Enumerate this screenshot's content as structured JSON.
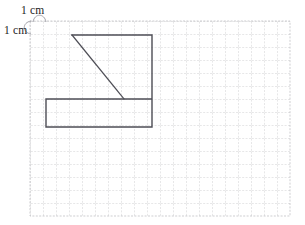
{
  "figure": {
    "background_color": "#ffffff",
    "labels": {
      "horizontal_cm": "1 cm",
      "vertical_cm": "1 cm"
    },
    "grid": {
      "origin_x": 30,
      "origin_y": 21,
      "cell_size_px": 13,
      "columns": 20,
      "rows": 15,
      "line_color": "#b9b9bd",
      "line_width": 0.7,
      "dash": "2,1.4"
    },
    "shape": {
      "stroke_color": "#4d4d55",
      "stroke_width": 1.4,
      "fill": "none",
      "outline_points": [
        [
          72,
          35
        ],
        [
          152,
          35
        ],
        [
          152,
          127
        ],
        [
          46,
          127
        ],
        [
          46,
          99
        ],
        [
          152,
          99
        ]
      ],
      "outline_segments": [
        {
          "name": "top-edge",
          "from": [
            72,
            35
          ],
          "to": [
            152,
            35
          ]
        },
        {
          "name": "right-edge",
          "from": [
            152,
            35
          ],
          "to": [
            152,
            127
          ]
        },
        {
          "name": "bottom-edge",
          "from": [
            152,
            127
          ],
          "to": [
            46,
            127
          ]
        },
        {
          "name": "left-edge",
          "from": [
            46,
            127
          ],
          "to": [
            46,
            99
          ]
        },
        {
          "name": "inner-horizontal-edge",
          "from": [
            46,
            99
          ],
          "to": [
            152,
            99
          ]
        }
      ],
      "diagonal": {
        "name": "diagonal-line",
        "from": [
          72,
          35
        ],
        "to": [
          124,
          99
        ]
      }
    },
    "measure_marks": {
      "horizontal_arc": {
        "from": [
          33,
          21
        ],
        "to": [
          46,
          21
        ],
        "apex_y": 13
      },
      "vertical_arc": {
        "from": [
          30,
          21
        ],
        "to": [
          30,
          34
        ],
        "apex_x": 22
      }
    }
  }
}
